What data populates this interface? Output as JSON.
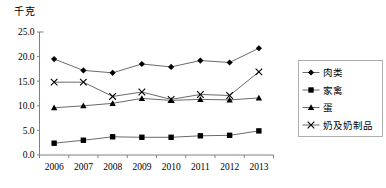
{
  "chart_data": {
    "type": "line",
    "title": "",
    "unit_label": "千克",
    "xlabel": "",
    "ylabel": "",
    "categories": [
      "2006",
      "2007",
      "2008",
      "2009",
      "2010",
      "2011",
      "2012",
      "2013"
    ],
    "ylim": [
      0.0,
      25.0
    ],
    "yticks": [
      "0.0",
      "5.0",
      "10.0",
      "15.0",
      "20.0",
      "25.0"
    ],
    "ytick_values": [
      0.0,
      5.0,
      10.0,
      15.0,
      20.0,
      25.0
    ],
    "grid": false,
    "legend_position": "right",
    "series": [
      {
        "name": "肉类",
        "marker": "diamond",
        "values": [
          19.5,
          17.2,
          16.7,
          18.5,
          17.9,
          19.2,
          18.8,
          21.7
        ]
      },
      {
        "name": "家禽",
        "marker": "square",
        "values": [
          2.4,
          3.0,
          3.7,
          3.6,
          3.6,
          3.9,
          4.0,
          4.9
        ]
      },
      {
        "name": "蛋",
        "marker": "triangle",
        "values": [
          9.6,
          10.0,
          10.5,
          11.5,
          11.1,
          11.3,
          11.2,
          11.6
        ]
      },
      {
        "name": "奶及奶制品",
        "marker": "x",
        "values": [
          14.8,
          14.8,
          11.9,
          12.8,
          11.3,
          12.3,
          12.1,
          16.9
        ]
      }
    ],
    "colors": {
      "line": "#595959",
      "marker": "#000000",
      "axis": "#808080",
      "legend_border": "#a6a6a6",
      "background": "#ffffff"
    }
  }
}
